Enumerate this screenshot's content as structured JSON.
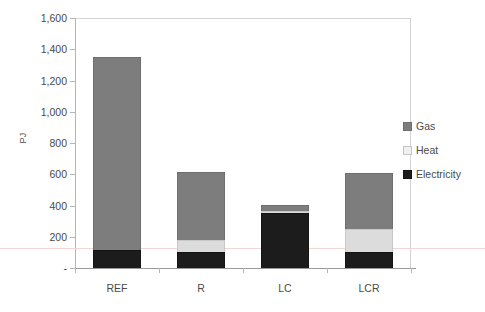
{
  "chart_data": {
    "type": "bar",
    "subtype": "stacked-bar-vertical",
    "title": "",
    "subtitle": "",
    "xlabel": "",
    "ylabel": "PJ",
    "categories": [
      "REF",
      "R",
      "LC",
      "LCR"
    ],
    "series": [
      {
        "name": "Electricity",
        "color": "#1c1c1c",
        "values": [
          115,
          100,
          355,
          105
        ]
      },
      {
        "name": "Heat",
        "color": "#dcdcdc",
        "values": [
          0,
          80,
          10,
          145
        ]
      },
      {
        "name": "Gas",
        "color": "#7d7d7d",
        "values": [
          1235,
          435,
          40,
          360
        ]
      }
    ],
    "stack_order_bottom_to_top": [
      "Electricity",
      "Heat",
      "Gas"
    ],
    "totals": [
      1350,
      615,
      405,
      610
    ],
    "ylim": [
      0,
      1600
    ],
    "ytick_values": [
      0,
      200,
      400,
      600,
      800,
      1000,
      1200,
      1400,
      1600
    ],
    "ytick_labels": [
      "-",
      "200",
      "400",
      "600",
      "800",
      "1,000",
      "1,200",
      "1,400",
      "1,600"
    ],
    "grid": false,
    "legend_position": "right",
    "legend_entries": [
      "Gas",
      "Heat",
      "Electricity"
    ]
  },
  "axes": {
    "y_title": "PJ",
    "y_ticks": [
      {
        "label": "1,600",
        "value": 1600
      },
      {
        "label": "1,400",
        "value": 1400
      },
      {
        "label": "1,200",
        "value": 1200
      },
      {
        "label": "1,000",
        "value": 1000
      },
      {
        "label": "800",
        "value": 800
      },
      {
        "label": "600",
        "value": 600
      },
      {
        "label": "400",
        "value": 400
      },
      {
        "label": "200",
        "value": 200
      },
      {
        "label": "-",
        "value": 0
      }
    ],
    "x_ticks": [
      {
        "label": "REF"
      },
      {
        "label": "R"
      },
      {
        "label": "LC"
      },
      {
        "label": "LCR"
      }
    ]
  },
  "legend": {
    "items": [
      {
        "label": "Gas",
        "color": "#7d7d7d"
      },
      {
        "label": "Heat",
        "color": "#f0f0f0"
      },
      {
        "label": "Electricity",
        "color": "#1c1c1c"
      }
    ]
  }
}
